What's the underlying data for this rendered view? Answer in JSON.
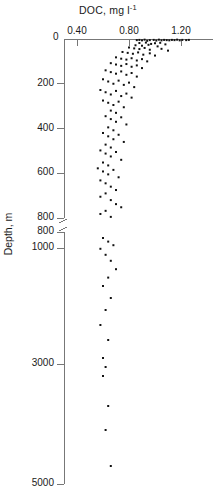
{
  "chart_data": {
    "type": "scatter",
    "title": "DOC, mg l",
    "title_sup": "-1",
    "title_full": "DOC, mg l^-1",
    "xlabel": "DOC, mg l^-1",
    "ylabel": "Depth, m",
    "ylabel_text": "Depth, m",
    "orientation": "depth-profile, y-axis inverted (depth increases downward)",
    "grid": false,
    "legend": null,
    "x_axis_position": "top",
    "xlim": [
      0.25,
      1.38
    ],
    "xticks": [
      0.4,
      0.8,
      1.2
    ],
    "xtick_labels": [
      "0.40",
      "0.80",
      "1.20"
    ],
    "corner_label": "0",
    "y_axis_broken": true,
    "y_break_note": "Scale break between 800 m (upper segment) and 800 m (lower segment); upper segment 0-800 m expanded, lower segment 800-5000 m compressed",
    "yticks_upper": [
      0,
      200,
      400,
      600,
      800
    ],
    "ytick_labels_upper": [
      "0",
      "200",
      "400",
      "600",
      "800"
    ],
    "yticks_lower": [
      800,
      1000,
      3000,
      5000
    ],
    "ytick_labels_lower": [
      "800",
      "1000",
      "3000",
      "5000"
    ],
    "ylim_upper": [
      0,
      800
    ],
    "ylim_lower": [
      800,
      5000
    ],
    "points": [
      [
        0.86,
        5
      ],
      [
        0.88,
        4
      ],
      [
        0.9,
        6
      ],
      [
        0.92,
        3
      ],
      [
        0.94,
        8
      ],
      [
        0.96,
        5
      ],
      [
        0.99,
        4
      ],
      [
        1.01,
        7
      ],
      [
        1.03,
        3
      ],
      [
        1.05,
        6
      ],
      [
        1.07,
        4
      ],
      [
        1.09,
        5
      ],
      [
        1.11,
        6
      ],
      [
        1.13,
        4
      ],
      [
        1.15,
        5
      ],
      [
        1.17,
        3
      ],
      [
        1.19,
        6
      ],
      [
        1.21,
        4
      ],
      [
        1.24,
        5
      ],
      [
        1.26,
        4
      ],
      [
        0.88,
        18
      ],
      [
        0.93,
        16
      ],
      [
        0.97,
        22
      ],
      [
        1.0,
        19
      ],
      [
        1.04,
        17
      ],
      [
        1.08,
        24
      ],
      [
        0.85,
        28
      ],
      [
        0.9,
        30
      ],
      [
        0.95,
        26
      ],
      [
        1.02,
        33
      ],
      [
        0.8,
        38
      ],
      [
        0.84,
        42
      ],
      [
        0.88,
        45
      ],
      [
        0.92,
        40
      ],
      [
        0.96,
        48
      ],
      [
        1.05,
        44
      ],
      [
        1.1,
        52
      ],
      [
        0.75,
        58
      ],
      [
        0.79,
        62
      ],
      [
        0.83,
        66
      ],
      [
        0.87,
        60
      ],
      [
        0.91,
        70
      ],
      [
        0.96,
        64
      ],
      [
        1.0,
        74
      ],
      [
        0.7,
        82
      ],
      [
        0.74,
        88
      ],
      [
        0.78,
        92
      ],
      [
        0.82,
        86
      ],
      [
        0.86,
        96
      ],
      [
        0.9,
        90
      ],
      [
        0.94,
        100
      ],
      [
        0.66,
        108
      ],
      [
        0.7,
        114
      ],
      [
        0.74,
        120
      ],
      [
        0.78,
        112
      ],
      [
        0.82,
        124
      ],
      [
        0.86,
        118
      ],
      [
        0.9,
        130
      ],
      [
        0.62,
        140
      ],
      [
        0.66,
        148
      ],
      [
        0.7,
        155
      ],
      [
        0.74,
        145
      ],
      [
        0.78,
        160
      ],
      [
        0.82,
        152
      ],
      [
        0.86,
        168
      ],
      [
        0.6,
        180
      ],
      [
        0.64,
        190
      ],
      [
        0.68,
        200
      ],
      [
        0.72,
        186
      ],
      [
        0.76,
        205
      ],
      [
        0.8,
        195
      ],
      [
        0.84,
        215
      ],
      [
        0.58,
        228
      ],
      [
        0.62,
        238
      ],
      [
        0.66,
        248
      ],
      [
        0.7,
        232
      ],
      [
        0.74,
        255
      ],
      [
        0.78,
        244
      ],
      [
        0.82,
        262
      ],
      [
        0.6,
        275
      ],
      [
        0.64,
        285
      ],
      [
        0.68,
        295
      ],
      [
        0.72,
        280
      ],
      [
        0.76,
        305
      ],
      [
        0.66,
        320
      ],
      [
        0.7,
        330
      ],
      [
        0.62,
        345
      ],
      [
        0.66,
        358
      ],
      [
        0.7,
        370
      ],
      [
        0.74,
        350
      ],
      [
        0.78,
        382
      ],
      [
        0.64,
        395
      ],
      [
        0.68,
        408
      ],
      [
        0.6,
        420
      ],
      [
        0.64,
        435
      ],
      [
        0.68,
        448
      ],
      [
        0.72,
        428
      ],
      [
        0.76,
        460
      ],
      [
        0.62,
        472
      ],
      [
        0.66,
        485
      ],
      [
        0.58,
        498
      ],
      [
        0.62,
        512
      ],
      [
        0.66,
        525
      ],
      [
        0.7,
        505
      ],
      [
        0.74,
        540
      ],
      [
        0.6,
        552
      ],
      [
        0.64,
        565
      ],
      [
        0.56,
        578
      ],
      [
        0.6,
        592
      ],
      [
        0.64,
        605
      ],
      [
        0.68,
        585
      ],
      [
        0.72,
        618
      ],
      [
        0.58,
        632
      ],
      [
        0.62,
        645
      ],
      [
        0.66,
        660
      ],
      [
        0.7,
        675
      ],
      [
        0.62,
        690
      ],
      [
        0.58,
        705
      ],
      [
        0.66,
        720
      ],
      [
        0.7,
        738
      ],
      [
        0.74,
        752
      ],
      [
        0.62,
        768
      ],
      [
        0.58,
        782
      ],
      [
        0.66,
        795
      ],
      [
        0.6,
        900
      ],
      [
        0.64,
        960
      ],
      [
        0.68,
        1020
      ],
      [
        0.58,
        1080
      ],
      [
        0.62,
        1180
      ],
      [
        0.66,
        1280
      ],
      [
        0.7,
        1420
      ],
      [
        0.64,
        1560
      ],
      [
        0.6,
        1700
      ],
      [
        0.66,
        1900
      ],
      [
        0.62,
        2100
      ],
      [
        0.58,
        2350
      ],
      [
        0.64,
        2600
      ],
      [
        0.6,
        2900
      ],
      [
        0.62,
        3050
      ],
      [
        0.6,
        3200
      ],
      [
        0.64,
        3700
      ],
      [
        0.62,
        4100
      ],
      [
        0.66,
        4700
      ]
    ],
    "point_count": 140,
    "marker": "square",
    "marker_color": "#111111",
    "marker_size_px": 2
  },
  "figure": {
    "background": "#ffffff",
    "axis_color": "#777777",
    "text_color": "#1a1a1a"
  }
}
